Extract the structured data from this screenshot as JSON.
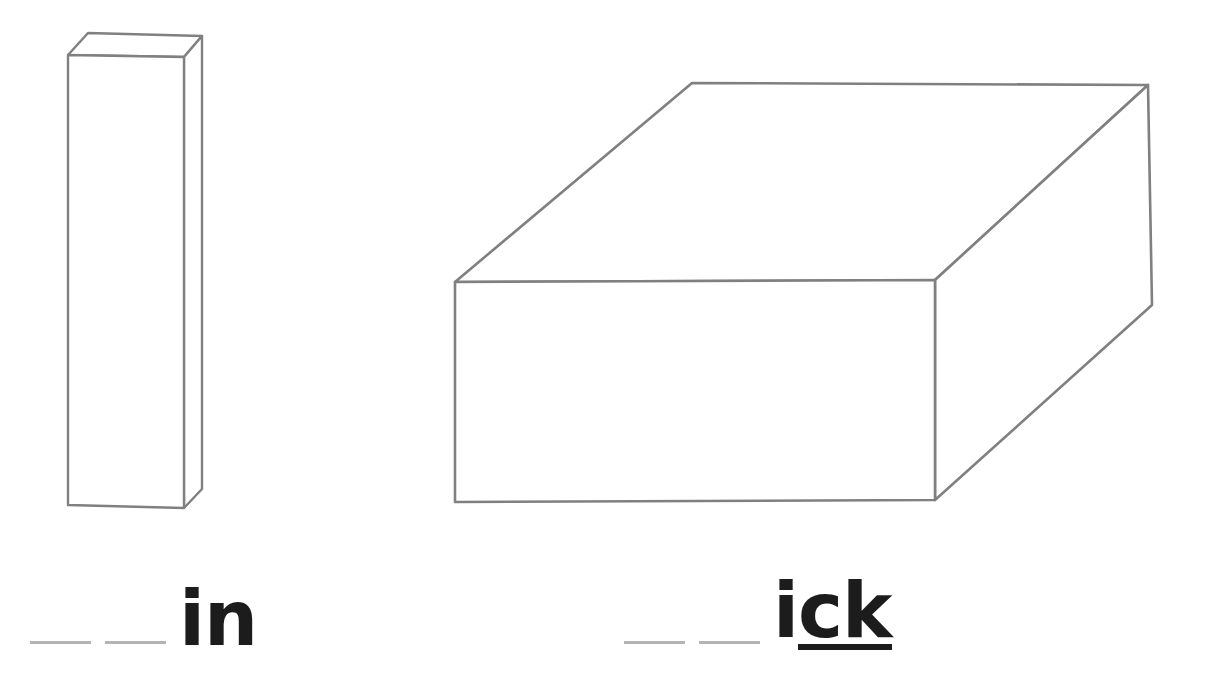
{
  "page": {
    "background_color": "#ffffff",
    "width": 1206,
    "height": 673
  },
  "style_colors": {
    "shape_outline": "#808080",
    "shape_fill": "#ffffff",
    "text_color": "#1c1c1c",
    "blank_line_color": "#b4b4b4",
    "underline_color": "#1c1c1c"
  },
  "figures": [
    {
      "name": "thin-tall-box",
      "description": "tall narrow 3D rectangular prism drawn in outline",
      "outline_color": "#808080",
      "fill_color": "#ffffff",
      "stroke_width": 2.4,
      "front_face": "68,55 184,57 184,508 68,505",
      "top_face": "68,55 88,33 202,36 184,57",
      "right_face": "184,57 202,36 202,489 184,508"
    },
    {
      "name": "wide-flat-box",
      "description": "wide flat 3D rectangular slab drawn in outline",
      "outline_color": "#808080",
      "fill_color": "#ffffff",
      "stroke_width": 2.6,
      "front_face": "455,282 935,280 935,500 455,502",
      "top_face": "455,282 692,83 1148,85 935,280",
      "right_face": "935,280 1148,85 1152,305 935,500"
    }
  ],
  "words": [
    {
      "name": "word-in",
      "blanks": 2,
      "blank_label": "blank",
      "prefix_blanks": [
        "",
        ""
      ],
      "ending": "in",
      "underlined_part": "",
      "plain_part": "in",
      "full_display": "__ __ in"
    },
    {
      "name": "word-ick",
      "blanks": 2,
      "blank_label": "blank",
      "prefix_blanks": [
        "",
        ""
      ],
      "ending": "ick",
      "underlined_part": "ck",
      "plain_part": "i",
      "full_display": "__ __ ick"
    }
  ]
}
